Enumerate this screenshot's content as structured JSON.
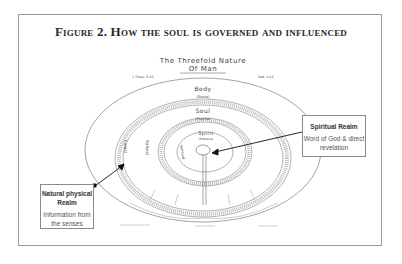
{
  "figure": {
    "title": "Figure 2. How the soul is governed and influenced"
  },
  "diagram": {
    "title_line1": "The Threefold Nature",
    "title_line2": "Of Man",
    "ref_left": "1 Thess. 5:23",
    "ref_right": "Heb. 4:12",
    "rings": {
      "body": {
        "label": "Body",
        "sub": "(Soma)"
      },
      "soul": {
        "label": "Soul",
        "sub": "(Psyche)"
      },
      "spirit": {
        "label": "Spirit",
        "sub": "(Pneuma)"
      }
    },
    "side_labels": {
      "carnal": "Carnal",
      "natural": "Natural",
      "spiritual": "Spiritual"
    }
  },
  "callouts": {
    "spiritual": {
      "title": "Spiritual Realm",
      "text": "Word of God & direct revelation"
    },
    "natural": {
      "title": "Natural physical Realm",
      "text": "Information from the senses"
    }
  },
  "colors": {
    "frame": "#9a9a9a",
    "ink": "#333333",
    "arrow": "#111111"
  }
}
